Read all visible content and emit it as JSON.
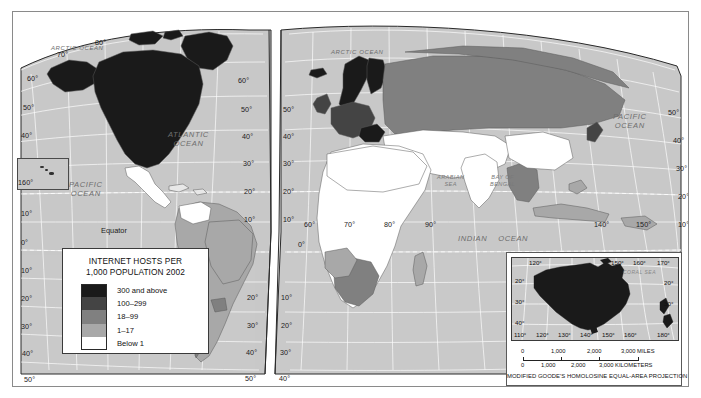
{
  "map": {
    "title": "INTERNET HOSTS PER 1,000 POPULATION 2002",
    "projection_note": "MODIFIED GOODE'S HOMOLOSINE EQUAL-AREA PROJECTION",
    "background_color": "#c9c9c9",
    "graticule_color": "#ffffff"
  },
  "legend": {
    "title_line1": "INTERNET HOSTS PER",
    "title_line2": "1,000 POPULATION 2002",
    "items": [
      {
        "label": "300 and above",
        "color": "#1a1a1a"
      },
      {
        "label": "100–299",
        "color": "#444444"
      },
      {
        "label": "18–99",
        "color": "#808080"
      },
      {
        "label": "1–17",
        "color": "#a8a8a8"
      },
      {
        "label": "Below 1",
        "color": "#ffffff"
      }
    ]
  },
  "ocean_labels": [
    {
      "name": "arctic-ocean-west",
      "text": "ARCTIC OCEAN"
    },
    {
      "name": "arctic-ocean-east",
      "text": "ARCTIC OCEAN"
    },
    {
      "name": "atlantic-ocean",
      "line1": "ATLANTIC",
      "line2": "OCEAN"
    },
    {
      "name": "pacific-ocean-west",
      "line1": "PACIFIC",
      "line2": "OCEAN"
    },
    {
      "name": "pacific-ocean-east",
      "line1": "PACIFIC",
      "line2": "OCEAN"
    },
    {
      "name": "indian-ocean",
      "line1": "INDIAN",
      "line2": "OCEAN"
    }
  ],
  "sea_labels": [
    {
      "name": "arabian-sea",
      "line1": "ARABIAN",
      "line2": "SEA"
    },
    {
      "name": "bay-of-bengal",
      "line1": "BAY OF",
      "line2": "BENGAL"
    },
    {
      "name": "coral-sea",
      "text": "CORAL SEA"
    }
  ],
  "equator_label": "Equator",
  "hawaii_inset": {
    "longitude_label": "160°"
  },
  "latitude_labels_left": [
    "70°",
    "60°",
    "50°",
    "40°",
    "30°",
    "10°",
    "0°",
    "10°",
    "20°",
    "30°",
    "40°",
    "50°"
  ],
  "latitude_labels_midA": [
    "60°",
    "50°",
    "40°",
    "30°",
    "20°",
    "10°",
    "0°",
    "10°",
    "20°",
    "30°",
    "40°",
    "50°"
  ],
  "latitude_labels_midB": [
    "50°",
    "40°",
    "30°",
    "20°",
    "10°",
    "0°",
    "10°",
    "20°",
    "30°",
    "40°",
    "50°"
  ],
  "latitude_labels_right": [
    "50°",
    "40°",
    "30°",
    "20°",
    "10°"
  ],
  "latitude_label_80": "80°",
  "longitude_labels_main": [
    "60°",
    "70°",
    "80°",
    "90°",
    "140°",
    "150°"
  ],
  "australia_inset": {
    "lat_left": [
      "20°",
      "30°",
      "40°"
    ],
    "lat_right": [
      "20°",
      "30°"
    ],
    "lon_top": [
      "120°",
      "150°",
      "160°",
      "170°"
    ],
    "lon_bottom": [
      "110°",
      "120°",
      "130°",
      "140°",
      "150°",
      "160°",
      "180°"
    ],
    "scale_miles": {
      "labels": [
        "0",
        "1,000",
        "2,000",
        "3,000 MILES"
      ]
    },
    "scale_km": {
      "labels": [
        "0",
        "1,000",
        "2,000",
        "3,000 KILOMETERS"
      ]
    }
  }
}
